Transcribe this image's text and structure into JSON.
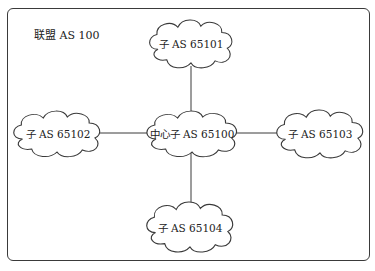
{
  "diagram": {
    "confederation_label": "联盟 AS 100",
    "colors": {
      "line": "#3a3a3a",
      "background": "#ffffff",
      "text": "#222222"
    },
    "nodes": [
      {
        "id": "center",
        "label": "中心子 AS 65100",
        "shape": "cloud",
        "cx": 192,
        "cy": 133
      },
      {
        "id": "top",
        "label": "子 AS 65101",
        "shape": "cloud",
        "cx": 191,
        "cy": 43
      },
      {
        "id": "left",
        "label": "子 AS 65102",
        "shape": "cloud",
        "cx": 57,
        "cy": 133
      },
      {
        "id": "right",
        "label": "子 AS 65103",
        "shape": "cloud",
        "cx": 320,
        "cy": 133
      },
      {
        "id": "bottom",
        "label": "子 AS 65104",
        "shape": "cloud",
        "cx": 190,
        "cy": 226
      }
    ],
    "edges": [
      {
        "from": "center",
        "to": "top"
      },
      {
        "from": "center",
        "to": "left"
      },
      {
        "from": "center",
        "to": "right"
      },
      {
        "from": "center",
        "to": "bottom"
      }
    ]
  }
}
